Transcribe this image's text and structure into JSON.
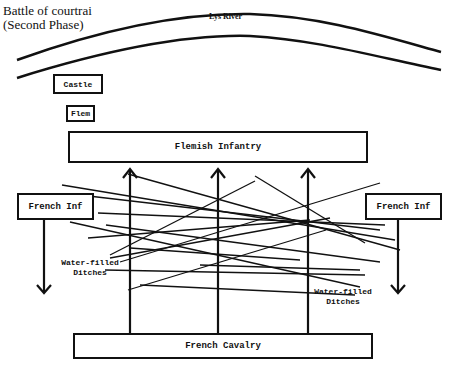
{
  "title": {
    "line1": "Battle of courtrai",
    "line2": "(Second Phase)"
  },
  "river": {
    "label": "Lys River"
  },
  "units": {
    "castle": "Castle",
    "flem": "Flem",
    "flemish_infantry": "Flemish Infantry",
    "french_inf_left": "French Inf",
    "french_inf_right": "French Inf",
    "french_cavalry": "French Cavalry"
  },
  "terrain": {
    "ditches_left": {
      "line1": "Water-filled",
      "line2": "Ditches"
    },
    "ditches_right": {
      "line1": "Water-filled",
      "line2": "Ditches"
    }
  },
  "colors": {
    "ink": "#111111",
    "background": "#ffffff"
  }
}
